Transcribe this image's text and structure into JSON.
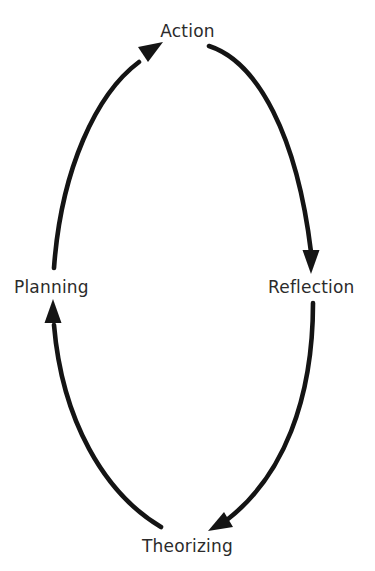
{
  "diagram": {
    "type": "cycle",
    "title": "",
    "direction": "clockwise",
    "background_color": "#ffffff",
    "stroke_color": "#141414",
    "text_color": "#2b2b2b",
    "nodes": [
      {
        "id": "action",
        "label": "Action",
        "position": "top"
      },
      {
        "id": "reflection",
        "label": "Reflection",
        "position": "right"
      },
      {
        "id": "theorizing",
        "label": "Theorizing",
        "position": "bottom"
      },
      {
        "id": "planning",
        "label": "Planning",
        "position": "left"
      }
    ],
    "edges": [
      {
        "id": "planning-to-action",
        "from": "Planning",
        "to": "Action",
        "arrowhead": "up-right"
      },
      {
        "id": "action-to-reflection",
        "from": "Action",
        "to": "Reflection",
        "arrowhead": "down"
      },
      {
        "id": "reflection-to-theorizing",
        "from": "Reflection",
        "to": "Theorizing",
        "arrowhead": "down-left"
      },
      {
        "id": "theorizing-to-planning",
        "from": "Theorizing",
        "to": "Planning",
        "arrowhead": "up"
      }
    ]
  }
}
